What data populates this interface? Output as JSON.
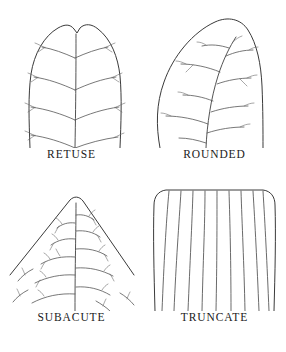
{
  "figure": {
    "background_color": "#ffffff",
    "line_color": "#3a3a3a",
    "layout": "2x2 grid of labeled botanical line drawings"
  },
  "panels": [
    {
      "id": "retuse",
      "label": "RETUSE",
      "position": "top-left",
      "apex_description": "broad rounded apex with a small central notch",
      "venation": "pinnate, opposite vein pairs angled upward from a straight central midrib",
      "vein_pair_count": 4
    },
    {
      "id": "rounded",
      "label": "ROUNDED",
      "position": "top-right",
      "apex_description": "asymmetric broadly rounded apex without a notch",
      "venation": "pinnate, alternate veins along an obliquely angled midrib",
      "vein_pair_count": 6
    },
    {
      "id": "subacute",
      "label": "SUBACUTE",
      "position": "bottom-left",
      "apex_description": "triangular apex with straight margins meeting at a slightly blunted point",
      "venation": "fine feathery dendritic branching along a vertical midrib",
      "vein_pair_count": 7
    },
    {
      "id": "truncate",
      "label": "TRUNCATE",
      "position": "bottom-right",
      "apex_description": "flat squared-off apex with rounded corners",
      "venation": "parallel veins running vertically and fanning slightly outward",
      "vein_count": 9
    }
  ]
}
